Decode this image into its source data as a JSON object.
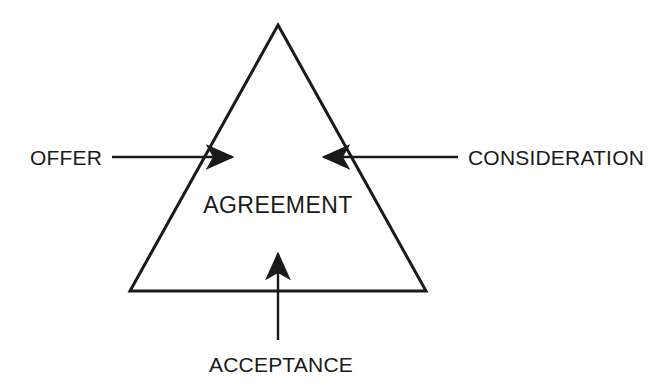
{
  "diagram": {
    "type": "triangle-relationship-diagram",
    "background_color": "#ffffff",
    "stroke_color": "#1a1a1a",
    "text_color": "#1a1a1a",
    "center": {
      "label": "AGREEMENT"
    },
    "shape": {
      "name": "triangle",
      "apex": {
        "x": 278,
        "y": 25
      },
      "base_left": {
        "x": 130,
        "y": 291
      },
      "base_right": {
        "x": 426,
        "y": 291
      },
      "stroke_width": 3
    },
    "elements": [
      {
        "id": "offer",
        "label": "OFFER",
        "side": "left",
        "arrow_direction": "right",
        "text_anchor": {
          "x": 30,
          "y": 165
        },
        "leader": {
          "x1": 112,
          "y1": 157,
          "x2": 232,
          "y2": 157
        },
        "arrow_tip": {
          "x": 246,
          "y": 157
        }
      },
      {
        "id": "consideration",
        "label": "CONSIDERATION",
        "side": "right",
        "arrow_direction": "left",
        "text_anchor": {
          "x": 468,
          "y": 165
        },
        "leader": {
          "x1": 458,
          "y1": 157,
          "x2": 324,
          "y2": 157
        },
        "arrow_tip": {
          "x": 310,
          "y": 157
        }
      },
      {
        "id": "acceptance",
        "label": "ACCEPTANCE",
        "side": "bottom",
        "arrow_direction": "up",
        "text_anchor": {
          "x": 281,
          "y": 372
        },
        "leader": {
          "x1": 278,
          "y1": 340,
          "x2": 278,
          "y2": 254
        },
        "arrow_tip": {
          "x": 278,
          "y": 240
        }
      }
    ]
  }
}
